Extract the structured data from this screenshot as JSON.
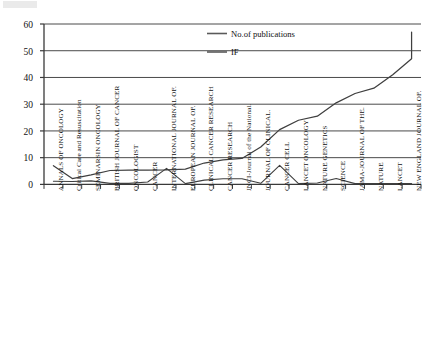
{
  "chart_data": {
    "type": "line",
    "title": "",
    "xlabel": "",
    "ylabel": "",
    "ylim": [
      0,
      60
    ],
    "yticks": [
      0,
      10,
      20,
      30,
      40,
      50,
      60
    ],
    "grid": true,
    "legend_position": "top-center",
    "categories": [
      "ANNALS OF ONCOLOGY",
      "Critical Care and Resuscitation",
      "SEMINARSIN ONCOLOGY",
      "BRITISH JOURNAL OF CANCER",
      "ONCOLOGIST",
      "CANCER",
      "INTERNATIONAL JOURNAL OF.",
      "EUROPEAN JOURNAL OF.",
      "CLINICAL CANCER RESEARCH",
      "CANCER RESEARCH",
      "JNCI-Journal of the National.",
      "JOURNAL OF CLINICAL.",
      "CANCER CELL",
      "LANCET ONCOLOGY",
      "NATURE GENETICS",
      "SCIENCE",
      "JAMA-JOURNAL OF THE.",
      "NATURE",
      "LANCET",
      "NEW ENGLAND JOURNAL OF."
    ],
    "series": [
      {
        "name": "No.of publications",
        "color": "#3f3f3f",
        "values": [
          7.0,
          2.2,
          3.6,
          5.2,
          5.3,
          5.3,
          5.4,
          5.7,
          8.0,
          9.2,
          9.7,
          14.0,
          20.5,
          24.0,
          25.5,
          30.5,
          34.0,
          36.0,
          41.0,
          47.0
        ]
      },
      {
        "name": "IF",
        "color": "#3f3f3f",
        "values": [
          1.2,
          1.1,
          1.3,
          0.4,
          0.4,
          0.9,
          6.0,
          0.3,
          1.6,
          2.1,
          2.1,
          0.4,
          7.1,
          0.3,
          0.5,
          2.2,
          0.3,
          0.3,
          0.3,
          0.3
        ]
      }
    ],
    "last_point_value": 57
  },
  "legend": {
    "items": [
      {
        "label": "No.of publications"
      },
      {
        "label": "IF"
      }
    ]
  },
  "axis": {
    "y_tick_labels": [
      "0",
      "10",
      "20",
      "30",
      "40",
      "50",
      "60"
    ]
  }
}
